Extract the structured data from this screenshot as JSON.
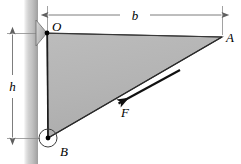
{
  "figure": {
    "canvas": {
      "width": 241,
      "height": 164,
      "background": "#ffffff"
    },
    "colors": {
      "triangle_fill": "#b3b3b3",
      "wall_light": "#f2f2f2",
      "wall_mid": "#c8c8c8",
      "wall_dark": "#9a9a9a",
      "line": "#1a1a1a",
      "dimension_line": "#6e6e6e",
      "label": "#000000"
    },
    "labels": {
      "point_o": "O",
      "point_a": "A",
      "point_b": "B",
      "dim_b": "b",
      "dim_h": "h",
      "force_f": "F"
    },
    "geometry": {
      "point_o": {
        "x": 47,
        "y": 33
      },
      "point_a": {
        "x": 222,
        "y": 37
      },
      "point_b": {
        "x": 48,
        "y": 138
      },
      "wall_left": 24,
      "wall_right": 38,
      "pin_radius_b": 9,
      "dim_b_y": 15,
      "dim_h_x": 12
    },
    "force": {
      "label": "F",
      "tail": {
        "x": 178,
        "y": 72
      },
      "head": {
        "x": 116,
        "y": 105
      },
      "direction": "down-left along hypotenuse toward B"
    },
    "elements": {
      "wall": "vertical-support-wall",
      "bracket": "right-triangle-bracket",
      "gusset": "small-triangular-gusset-at-o",
      "pin": "pin-joint-circle-at-b"
    }
  }
}
